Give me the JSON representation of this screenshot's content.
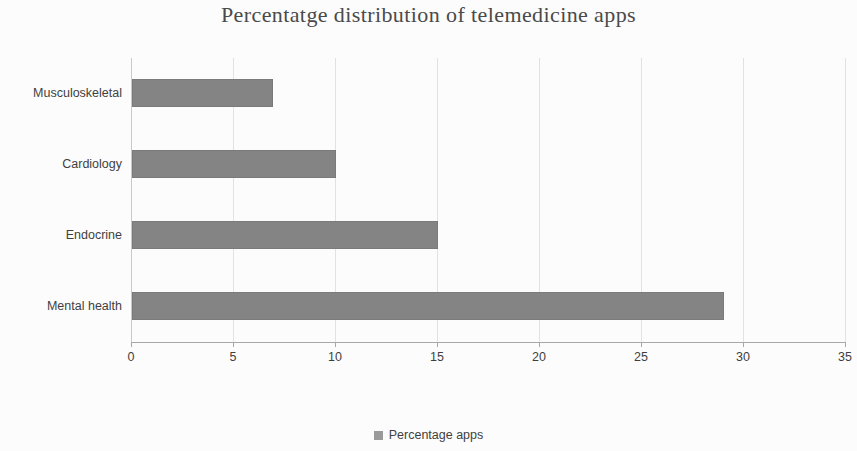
{
  "chart_data": {
    "type": "bar",
    "orientation": "horizontal",
    "title": "Percentatge distribution of telemedicine apps",
    "xlabel": "",
    "ylabel": "",
    "categories": [
      "Musculoskeletal",
      "Cardiology",
      "Endocrine",
      "Mental health"
    ],
    "values": [
      6.9,
      10,
      15,
      29
    ],
    "series": [
      {
        "name": "Percentage apps",
        "values": [
          6.9,
          10,
          15,
          29
        ],
        "color": "#848484"
      }
    ],
    "xlim": [
      0,
      35
    ],
    "xticks": [
      0,
      5,
      10,
      15,
      20,
      25,
      30,
      35
    ],
    "xtick_labels": [
      "0",
      "5",
      "10",
      "15",
      "20",
      "25",
      "30",
      "35"
    ],
    "grid": "vertical",
    "legend": {
      "position": "bottom",
      "entries": [
        {
          "label": "Percentage apps",
          "color": "#9a9a9a",
          "marker": "square"
        }
      ]
    },
    "colors": {
      "bar": "#848484",
      "bar_border": "#7a7a7a",
      "gridline": "#e2e2e2",
      "axis": "#a8a8a8",
      "text": "#3f3f3f",
      "title_text": "#4a4a4a",
      "background": "#fcfcfc"
    }
  }
}
